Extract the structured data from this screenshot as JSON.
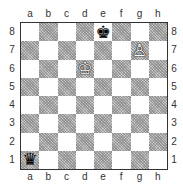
{
  "board": {
    "files": [
      "a",
      "b",
      "c",
      "d",
      "e",
      "f",
      "g",
      "h"
    ],
    "ranks": [
      "8",
      "7",
      "6",
      "5",
      "4",
      "3",
      "2",
      "1"
    ],
    "light_color": "#ffffff",
    "dark_color": "#c8c8c8",
    "pieces": [
      {
        "square": "e8",
        "color": "black",
        "type": "king",
        "glyph": "♚"
      },
      {
        "square": "g7",
        "color": "white",
        "type": "pawn",
        "glyph": "♙"
      },
      {
        "square": "d6",
        "color": "white",
        "type": "king",
        "glyph": "♔"
      },
      {
        "square": "a1",
        "color": "black",
        "type": "queen",
        "glyph": "♛"
      }
    ]
  },
  "labels": {
    "top_files": [
      "a",
      "b",
      "c",
      "d",
      "e",
      "f",
      "g",
      "h"
    ],
    "bottom_files": [
      "a",
      "b",
      "c",
      "d",
      "e",
      "f",
      "g",
      "h"
    ],
    "left_ranks": [
      "8",
      "7",
      "6",
      "5",
      "4",
      "3",
      "2",
      "1"
    ],
    "right_ranks": [
      "8",
      "7",
      "6",
      "5",
      "4",
      "3",
      "2",
      "1"
    ]
  }
}
